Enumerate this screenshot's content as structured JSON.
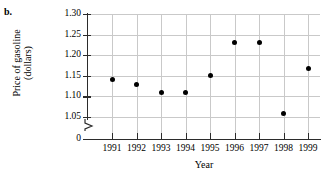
{
  "part_label": "b.",
  "chart_data": {
    "type": "scatter",
    "title": "",
    "xlabel": "Year",
    "ylabel": "Price of gasoline (dollars)",
    "ylabel_line1": "Price of gasoline",
    "ylabel_line2": "(dollars)",
    "categories": [
      1991,
      1992,
      1993,
      1994,
      1995,
      1996,
      1997,
      1998,
      1999
    ],
    "x": [
      "1991",
      "1992",
      "1993",
      "1994",
      "1995",
      "1996",
      "1997",
      "1998",
      "1999"
    ],
    "values": [
      1.14,
      1.13,
      1.11,
      1.11,
      1.15,
      1.23,
      1.23,
      1.058,
      1.168
    ],
    "xtick_labels": [
      "1991",
      "1992",
      "1993",
      "1994",
      "1995",
      "1996",
      "1997",
      "1998",
      "1999"
    ],
    "ytick_labels": [
      "1.30",
      "1.25",
      "1.20",
      "1.15",
      "1.10",
      "1.05",
      "0"
    ],
    "ytick_values": [
      1.3,
      1.25,
      1.2,
      1.15,
      1.1,
      1.05,
      0
    ],
    "ylim": [
      1.0125,
      1.3
    ],
    "xlim": [
      1990.5,
      1999.5
    ],
    "y_axis_break": true,
    "grid": true,
    "grid_color": "#c9c9c9",
    "marker_color": "#000000",
    "axis_color": "#2b2b2b",
    "legend": "none",
    "series": [
      {
        "name": "Price of gasoline",
        "points": [
          {
            "x": "1991",
            "y": 1.14
          },
          {
            "x": "1992",
            "y": 1.13
          },
          {
            "x": "1993",
            "y": 1.11
          },
          {
            "x": "1994",
            "y": 1.11
          },
          {
            "x": "1995",
            "y": 1.15
          },
          {
            "x": "1996",
            "y": 1.23
          },
          {
            "x": "1997",
            "y": 1.23
          },
          {
            "x": "1998",
            "y": 1.058
          },
          {
            "x": "1999",
            "y": 1.168
          }
        ]
      }
    ]
  }
}
